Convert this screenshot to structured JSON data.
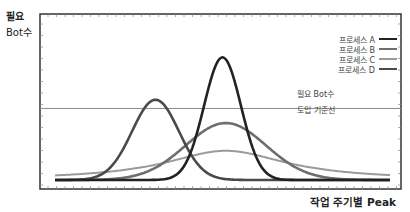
{
  "chart_data": {
    "type": "line",
    "title": "",
    "ylabel": [
      "필요",
      "Bot수"
    ],
    "xlabel": "작업 주기별 Peak",
    "xlim": [
      0,
      100
    ],
    "ylim": [
      0,
      100
    ],
    "grid": false,
    "legend_position": "top-right",
    "series": [
      {
        "name": "프로세스 A",
        "color": "#222222",
        "shape": "gaussian",
        "center": 50,
        "spread": 5.5,
        "peak": 84,
        "base": 0
      },
      {
        "name": "프로세스 B",
        "color": "#6e6e6e",
        "shape": "gaussian",
        "center": 51,
        "spread": 12,
        "peak": 39,
        "base": 0
      },
      {
        "name": "프로세스 C",
        "color": "#9a9a9a",
        "shape": "lorentzian",
        "center": 51,
        "spread": 22,
        "peak": 20,
        "base": 0
      },
      {
        "name": "프로세스 D",
        "color": "#4a4a4a",
        "shape": "gaussian",
        "center": 30,
        "spread": 7,
        "peak": 55,
        "base": 0
      }
    ],
    "threshold": {
      "value": 49,
      "label": [
        "필요 Bot수",
        "도입 기준선"
      ],
      "color": "#8a8a8a"
    }
  }
}
